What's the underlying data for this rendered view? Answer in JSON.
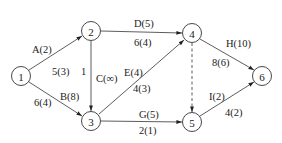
{
  "nodes": [
    {
      "id": "1",
      "label": "1",
      "x": 21,
      "y": 76
    },
    {
      "id": "2",
      "label": "2",
      "x": 91,
      "y": 31
    },
    {
      "id": "3",
      "label": "3",
      "x": 91,
      "y": 121
    },
    {
      "id": "4",
      "label": "4",
      "x": 192,
      "y": 33
    },
    {
      "id": "5",
      "label": "5",
      "x": 192,
      "y": 122
    },
    {
      "id": "6",
      "label": "6",
      "x": 262,
      "y": 76
    }
  ],
  "edges": [
    {
      "from": "1",
      "to": "2",
      "activity": "A(2)",
      "value": "5(3)",
      "style": "solid"
    },
    {
      "from": "1",
      "to": "3",
      "activity": "B(8)",
      "value": "6(4)",
      "style": "solid"
    },
    {
      "from": "2",
      "to": "3",
      "activity": "C(∞)",
      "value": "1",
      "style": "solid"
    },
    {
      "from": "2",
      "to": "4",
      "activity": "D(5)",
      "value": "6(4)",
      "style": "solid"
    },
    {
      "from": "3",
      "to": "4",
      "activity": "E(4)",
      "value": "4(3)",
      "style": "solid"
    },
    {
      "from": "3",
      "to": "5",
      "activity": "G(5)",
      "value": "2(1)",
      "style": "solid"
    },
    {
      "from": "4",
      "to": "5",
      "activity": "",
      "value": "",
      "style": "dashed"
    },
    {
      "from": "4",
      "to": "6",
      "activity": "H(10)",
      "value": "8(6)",
      "style": "solid"
    },
    {
      "from": "5",
      "to": "6",
      "activity": "I(2)",
      "value": "4(2)",
      "style": "solid"
    }
  ]
}
